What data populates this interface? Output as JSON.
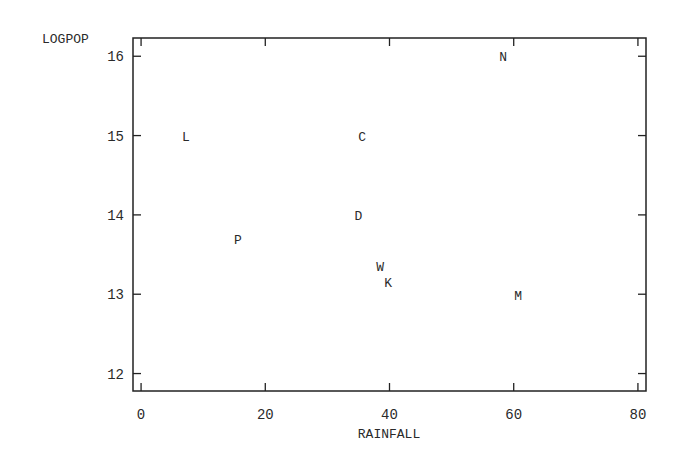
{
  "chart_data": {
    "type": "scatter",
    "title": "",
    "xlabel": "RAINFALL",
    "ylabel": "LOGPOP",
    "xlim": [
      -1.3,
      81.3
    ],
    "ylim": [
      11.78,
      16.23
    ],
    "xticks": [
      0,
      20,
      40,
      60,
      80
    ],
    "yticks": [
      12,
      13,
      14,
      15,
      16
    ],
    "grid": false,
    "legend": null,
    "marker": "letter labels",
    "points": [
      {
        "label": "L",
        "x": 7.2,
        "y": 15.0
      },
      {
        "label": "C",
        "x": 35.6,
        "y": 15.0
      },
      {
        "label": "N",
        "x": 58.3,
        "y": 16.0
      },
      {
        "label": "D",
        "x": 35.0,
        "y": 14.0
      },
      {
        "label": "P",
        "x": 15.6,
        "y": 13.7
      },
      {
        "label": "W",
        "x": 38.5,
        "y": 13.36
      },
      {
        "label": "K",
        "x": 39.8,
        "y": 13.16
      },
      {
        "label": "M",
        "x": 60.7,
        "y": 12.99
      }
    ]
  },
  "colors": {
    "axis": "#222222",
    "text": "#2a2a2a",
    "background": "#ffffff"
  }
}
